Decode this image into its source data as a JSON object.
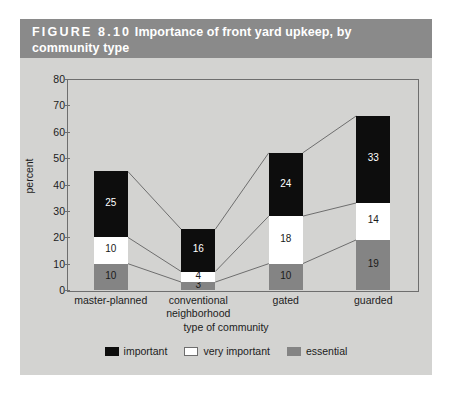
{
  "figure": {
    "number": "FIGURE  8.10",
    "title": "Importance of front yard upkeep, by community type",
    "title_line1": "FIGURE  8.10   Importance of front yard upkeep, by",
    "title_line2": "community type"
  },
  "colors": {
    "panel_background": "#d3d3d1",
    "title_bar": "#8a8a8a",
    "important": "#0d0d0d",
    "very_important": "#ffffff",
    "essential": "#848484",
    "axis": "#6e6e6e",
    "connector": "#6e6e6e"
  },
  "legend": {
    "position": "bottom",
    "items": [
      {
        "label": "important",
        "color": "#0d0d0d",
        "swatch": "important-swatch"
      },
      {
        "label": "very important",
        "color": "#ffffff",
        "swatch": "very-important-swatch"
      },
      {
        "label": "essential",
        "color": "#848484",
        "swatch": "essential-swatch"
      }
    ]
  },
  "chart_data": {
    "type": "bar",
    "stacked": true,
    "title": "Importance of front yard upkeep, by community type",
    "xlabel": "type of community",
    "ylabel": "percent",
    "ylim": [
      0,
      80
    ],
    "yticks": [
      0,
      10,
      20,
      30,
      40,
      50,
      60,
      70,
      80
    ],
    "ytick_labels": [
      "0",
      "10",
      "20",
      "30",
      "40",
      "50",
      "60",
      "70",
      "80"
    ],
    "grid": false,
    "legend_position": "bottom",
    "categories": [
      "master-planned",
      "conventional neighborhood",
      "gated",
      "guarded"
    ],
    "category_lines": [
      [
        "master-planned",
        ""
      ],
      [
        "conventional",
        "neighborhood"
      ],
      [
        "gated",
        ""
      ],
      [
        "guarded",
        ""
      ]
    ],
    "series": [
      {
        "name": "essential",
        "color": "#848484",
        "values": [
          10,
          3,
          10,
          19
        ]
      },
      {
        "name": "very important",
        "color": "#ffffff",
        "values": [
          10,
          4,
          18,
          14
        ]
      },
      {
        "name": "important",
        "color": "#0d0d0d",
        "values": [
          25,
          16,
          24,
          33
        ]
      }
    ],
    "totals": [
      45,
      23,
      52,
      66
    ],
    "connector_lines": true
  }
}
